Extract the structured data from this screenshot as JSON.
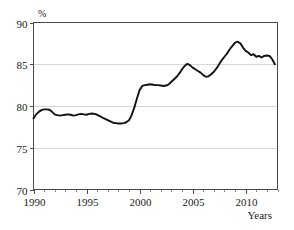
{
  "chart_data": {
    "type": "line",
    "title": "",
    "subtitle": "",
    "xlabel": "Years",
    "ylabel": "%",
    "unit_label": "%",
    "xlim": [
      1990,
      2013
    ],
    "ylim": [
      70,
      90
    ],
    "grid": true,
    "legend": "none",
    "y_ticks": [
      70,
      75,
      80,
      85,
      90
    ],
    "y_tick_labels": [
      "70",
      "75",
      "80",
      "85",
      "90"
    ],
    "x_ticks": [
      1990,
      1995,
      2000,
      2005,
      2010
    ],
    "x_tick_labels": [
      "1990",
      "1995",
      "2000",
      "2005",
      "2010"
    ],
    "x_minor_ticks": [
      1991,
      1992,
      1993,
      1994,
      1996,
      1997,
      1998,
      1999,
      2001,
      2002,
      2003,
      2004,
      2006,
      2007,
      2008,
      2009,
      2011,
      2012,
      2013
    ],
    "line_color": "#111111",
    "grid_color": "#d6d6d6",
    "axis_color": "#4a4a4a",
    "background_color": "#ffffff",
    "series": [
      {
        "name": "rate",
        "x": [
          1990.0,
          1990.25,
          1990.5,
          1990.75,
          1991.0,
          1991.25,
          1991.5,
          1991.75,
          1992.0,
          1992.25,
          1992.5,
          1992.75,
          1993.0,
          1993.25,
          1993.5,
          1993.75,
          1994.0,
          1994.25,
          1994.5,
          1994.75,
          1995.0,
          1995.25,
          1995.5,
          1995.75,
          1996.0,
          1996.25,
          1996.5,
          1996.75,
          1997.0,
          1997.25,
          1997.5,
          1997.75,
          1998.0,
          1998.25,
          1998.5,
          1998.75,
          1999.0,
          1999.25,
          1999.5,
          1999.75,
          2000.0,
          2000.25,
          2000.5,
          2000.75,
          2001.0,
          2001.25,
          2001.5,
          2001.75,
          2002.0,
          2002.25,
          2002.5,
          2002.75,
          2003.0,
          2003.25,
          2003.5,
          2003.75,
          2004.0,
          2004.25,
          2004.5,
          2004.75,
          2005.0,
          2005.25,
          2005.5,
          2005.75,
          2006.0,
          2006.25,
          2006.5,
          2006.75,
          2007.0,
          2007.25,
          2007.5,
          2007.75,
          2008.0,
          2008.25,
          2008.5,
          2008.75,
          2009.0,
          2009.25,
          2009.5,
          2009.75,
          2010.0,
          2010.25,
          2010.5,
          2010.75,
          2011.0,
          2011.25,
          2011.5,
          2011.75,
          2012.0,
          2012.25,
          2012.5,
          2012.75
        ],
        "values": [
          78.5,
          79.0,
          79.3,
          79.5,
          79.6,
          79.6,
          79.55,
          79.3,
          79.0,
          78.9,
          78.85,
          78.9,
          78.95,
          79.0,
          78.95,
          78.85,
          78.9,
          79.0,
          79.05,
          79.0,
          78.95,
          79.05,
          79.1,
          79.05,
          78.95,
          78.8,
          78.6,
          78.45,
          78.3,
          78.15,
          78.0,
          77.95,
          77.9,
          77.9,
          77.95,
          78.05,
          78.3,
          78.9,
          79.8,
          80.9,
          81.9,
          82.4,
          82.5,
          82.55,
          82.6,
          82.55,
          82.5,
          82.5,
          82.45,
          82.4,
          82.45,
          82.6,
          82.9,
          83.2,
          83.5,
          83.9,
          84.4,
          84.8,
          85.05,
          84.9,
          84.6,
          84.4,
          84.2,
          84.0,
          83.7,
          83.5,
          83.55,
          83.8,
          84.1,
          84.5,
          85.0,
          85.5,
          85.9,
          86.3,
          86.8,
          87.2,
          87.6,
          87.7,
          87.5,
          87.0,
          86.6,
          86.4,
          86.1,
          86.2,
          85.9,
          86.0,
          85.8,
          86.0,
          86.05,
          86.0,
          85.6,
          85.0
        ]
      }
    ],
    "annotations": [
      {
        "label": "start",
        "x": 1990,
        "y": 78.5
      },
      {
        "label": "early-peak",
        "x": 1991,
        "y": 79.6
      },
      {
        "label": "trough",
        "x": 1998,
        "y": 77.9
      },
      {
        "label": "plateau",
        "x": 2001,
        "y": 82.6
      },
      {
        "label": "mid-peak",
        "x": 2004.5,
        "y": 85.05
      },
      {
        "label": "mid-dip",
        "x": 2006.25,
        "y": 83.5
      },
      {
        "label": "max-peak",
        "x": 2009.25,
        "y": 87.7
      },
      {
        "label": "end",
        "x": 2012.75,
        "y": 85.0
      }
    ]
  }
}
